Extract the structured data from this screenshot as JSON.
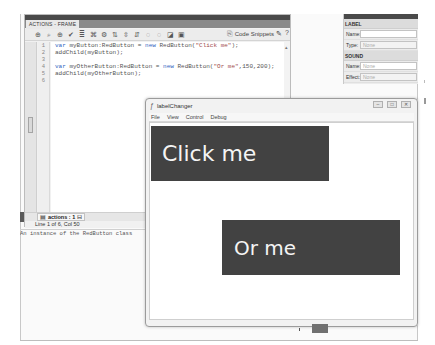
{
  "actions_panel": {
    "tab_label": "ACTIONS - FRAME",
    "toolbar_icons": [
      "add-statement-icon",
      "find-icon",
      "target-icon",
      "check-syntax-icon",
      "auto-format-icon",
      "code-hint-icon",
      "debug-options-icon",
      "collapse-between-icon",
      "collapse-selection-icon",
      "expand-all-icon",
      "block-comment-icon",
      "line-comment-icon",
      "remove-comment-icon",
      "show-hide-toolbox-icon"
    ],
    "code_snippets_label": "Code Snippets",
    "line_numbers": [
      "1",
      "2",
      "3",
      "4",
      "5",
      "6"
    ],
    "code_lines": [
      {
        "kw": "var",
        "text": " myButton:RedButton = ",
        "kw2": "new",
        "text2": " RedButton(",
        "str": "\"Click me\"",
        "end": ");"
      },
      {
        "kw": "",
        "text": "addChild(myButton);",
        "kw2": "",
        "text2": "",
        "str": "",
        "end": ""
      },
      {
        "kw": "",
        "text": "",
        "kw2": "",
        "text2": "",
        "str": "",
        "end": ""
      },
      {
        "kw": "var",
        "text": " myOtherButton:RedButton = ",
        "kw2": "new",
        "text2": " RedButton(",
        "str": "\"Or me\"",
        "end": ",150,200);"
      },
      {
        "kw": "",
        "text": "addChild(myOtherButton);",
        "kw2": "",
        "text2": "",
        "str": "",
        "end": ""
      },
      {
        "kw": "",
        "text": "",
        "kw2": "",
        "text2": "",
        "str": "",
        "end": ""
      }
    ],
    "script_tab": "actions : 1",
    "status": "Line 1 of 6, Col 50"
  },
  "output": {
    "text": "An instance of the RedButton class"
  },
  "properties_panel": {
    "section_label": "LABEL",
    "name_label": "Name:",
    "name_value": "",
    "type_label": "Type:",
    "type_value": "None",
    "sound_section": "SOUND",
    "sound_name_label": "Name:",
    "sound_name_value": "None",
    "effect_label": "Effect:",
    "effect_value": "None"
  },
  "player_window": {
    "title": "labelChanger",
    "menu": [
      "File",
      "View",
      "Control",
      "Debug"
    ],
    "controls": {
      "minimize": "–",
      "maximize": "□",
      "close": "✕"
    },
    "buttons": [
      {
        "label": "Click me",
        "color": "#424242"
      },
      {
        "label": "Or me",
        "color": "#424242"
      }
    ]
  }
}
